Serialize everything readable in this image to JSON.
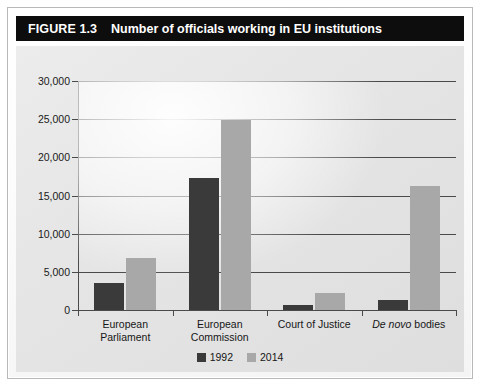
{
  "figure": {
    "number": "FIGURE 1.3",
    "title": "Number of officials working in EU institutions"
  },
  "colors": {
    "series_1992": "#3a3a3a",
    "series_2014": "#a8a8a8",
    "axis": "#4a4a4a",
    "title_bar_bg": "#0d0d0d",
    "title_bar_text": "#ffffff",
    "panel_bg": "#e6e6e6"
  },
  "legend": {
    "position": "bottom-center",
    "items": [
      {
        "label": "1992",
        "color": "#3a3a3a"
      },
      {
        "label": "2014",
        "color": "#a8a8a8"
      }
    ]
  },
  "axis": {
    "y_ticks": [
      "30,000",
      "25,000",
      "20,000",
      "15,000",
      "10,000",
      "5,000",
      "0"
    ],
    "y_tick_values": [
      30000,
      25000,
      20000,
      15000,
      10000,
      5000,
      0
    ]
  },
  "categories_display": [
    {
      "line1": "European",
      "line2": "Parliament",
      "italic_part": ""
    },
    {
      "line1": "European",
      "line2": "Commission",
      "italic_part": ""
    },
    {
      "line1": "Court of Justice",
      "line2": "",
      "italic_part": ""
    },
    {
      "line1": "",
      "line2": "",
      "italic_part": "De novo",
      "rest": " bodies"
    }
  ],
  "chart_data": {
    "type": "bar",
    "title": "Number of officials working in EU institutions",
    "xlabel": "",
    "ylabel": "",
    "ylim": [
      0,
      30000
    ],
    "ytick_step": 5000,
    "grid": true,
    "grid_axis": "y",
    "legend_position": "bottom-center",
    "categories": [
      "European Parliament",
      "European Commission",
      "Court of Justice",
      "De novo bodies"
    ],
    "series": [
      {
        "name": "1992",
        "color": "#3a3a3a",
        "values": [
          3500,
          17300,
          700,
          1300
        ]
      },
      {
        "name": "2014",
        "color": "#a8a8a8",
        "values": [
          6800,
          24900,
          2200,
          16200
        ]
      }
    ]
  }
}
